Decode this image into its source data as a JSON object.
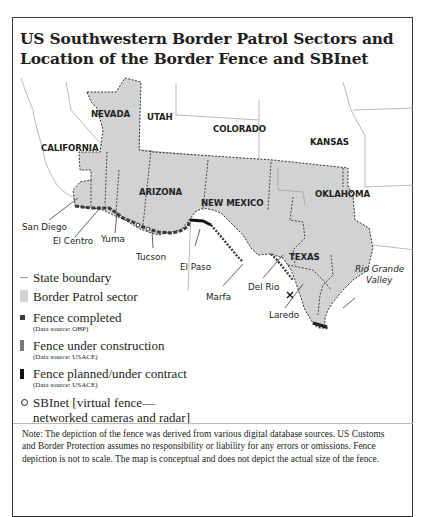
{
  "title": "US Southwestern Border Patrol Sectors and Location of the Border Fence and SBInet",
  "map": {
    "states": [
      {
        "name": "NEVADA",
        "x": 93,
        "y": 47
      },
      {
        "name": "UTAH",
        "x": 150,
        "y": 50
      },
      {
        "name": "COLORADO",
        "x": 214,
        "y": 62
      },
      {
        "name": "KANSAS",
        "x": 310,
        "y": 75
      },
      {
        "name": "CALIFORNIA",
        "x": 38,
        "y": 80
      },
      {
        "name": "ARIZONA",
        "x": 126,
        "y": 125
      },
      {
        "name": "NEW MEXICO",
        "x": 187,
        "y": 134
      },
      {
        "name": "OKLAHOMA",
        "x": 313,
        "y": 127
      },
      {
        "name": "TEXAS",
        "x": 289,
        "y": 190
      }
    ],
    "sectors": [
      {
        "name": "San Diego"
      },
      {
        "name": "El Centro"
      },
      {
        "name": "Yuma"
      },
      {
        "name": "Tucson"
      },
      {
        "name": "El Paso"
      },
      {
        "name": "Marfa"
      },
      {
        "name": "Del Rio"
      },
      {
        "name": "Laredo"
      },
      {
        "name": "Rio Grande Valley",
        "line1": "Rio Grande",
        "line2": "Valley"
      }
    ],
    "colors": {
      "sector_fill": "#d1d2d4",
      "state_boundary": "#9b9b9b",
      "sector_boundary": "#231f20",
      "fence_completed": "#3a3a3a",
      "fence_under_construction": "#7a7a7a",
      "fence_planned": "#111111"
    }
  },
  "legend": {
    "items": [
      {
        "label": "State boundary",
        "symbol": "line"
      },
      {
        "label": "Border Patrol sector",
        "symbol": "gray-box"
      },
      {
        "label": "Fence completed",
        "source": "(Data source: OBP)",
        "symbol": "dark-square"
      },
      {
        "label": "Fence under construction",
        "source": "(Data source: USACE)",
        "symbol": "gray-bar"
      },
      {
        "label": "Fence planned/under contract",
        "source": "(Data source: USACE)",
        "symbol": "black-bar"
      },
      {
        "label": "SBInet [virtual fence—",
        "label2": "networked cameras and radar]",
        "symbol": "circle"
      }
    ]
  },
  "note": "Note: The depiction of the fence was derived from various digital database sources. US Customs and Border Protection assumes no responsibility or liability for any errors or omissions. Fence depiction is not to scale. The map is conceptual and does not depict the actual size of the fence."
}
